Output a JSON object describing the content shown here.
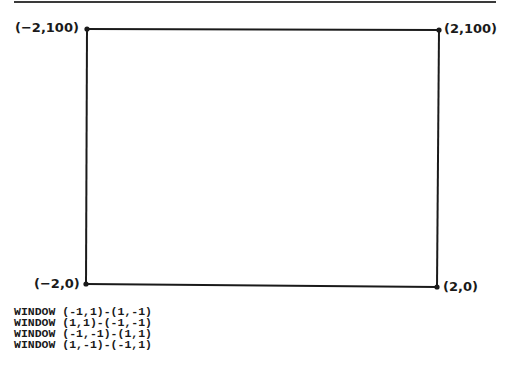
{
  "figure": {
    "corners": {
      "top_left": "(−2,100)",
      "top_right": "(2,100)",
      "bottom_left": "(−2,0)",
      "bottom_right": "(2,0)"
    },
    "line_color": "#1a1a1a"
  },
  "code": {
    "lines": [
      "WINDOW (-1,1)-(1,-1)",
      "WINDOW (1,1)-(-1,-1)",
      "WINDOW (-1,-1)-(1,1)",
      "WINDOW (1,-1)-(-1,1)"
    ]
  }
}
